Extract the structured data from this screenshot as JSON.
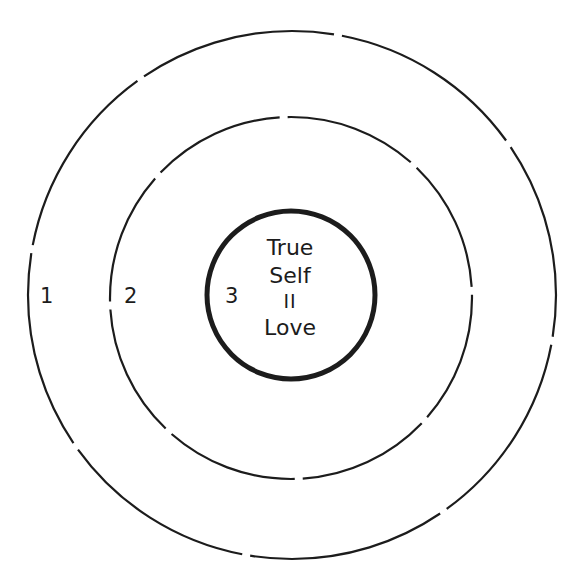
{
  "diagram": {
    "type": "concentric-circles",
    "circles": [
      {
        "id": 1,
        "label": "1",
        "style": "dashed",
        "cx": 292,
        "cy": 295,
        "r": 264
      },
      {
        "id": 2,
        "label": "2",
        "style": "dashed",
        "cx": 291,
        "cy": 298,
        "r": 181
      },
      {
        "id": 3,
        "label": "3",
        "style": "solid-thick",
        "cx": 291,
        "cy": 295,
        "r": 84
      }
    ],
    "center": {
      "line1": "True",
      "line2": "Self",
      "line3": "II",
      "line4": "Love"
    },
    "stroke_color": "#1c1c1c",
    "background": "#ffffff"
  }
}
